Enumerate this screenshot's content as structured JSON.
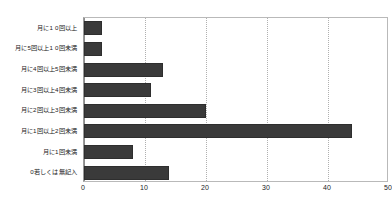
{
  "chart_data": {
    "type": "bar",
    "orientation": "horizontal",
    "title": "",
    "subtitle": "",
    "xlabel": "",
    "ylabel": "",
    "xlim": [
      0,
      50
    ],
    "xticks": [
      "0",
      "10",
      "20",
      "30",
      "40",
      "50"
    ],
    "xtick_values": [
      0,
      10,
      20,
      30,
      40,
      50
    ],
    "grid": true,
    "legend": false,
    "legend_position": "none",
    "bar_color": "#3a3a3a",
    "categories": [
      "月に1 0回以上",
      "月に5回以上1 0回未満",
      "月に4回以上5回未満",
      "月に3回以上4回未満",
      "月に2回以上3回未満",
      "月に1回以上2回未満",
      "月に1回未満",
      "0若しくは無記入"
    ],
    "values": [
      3,
      3,
      13,
      11,
      20,
      44,
      8,
      14
    ]
  }
}
